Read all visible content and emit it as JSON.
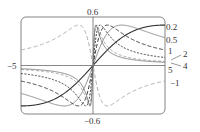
{
  "chart_data": {
    "type": "line",
    "title": "",
    "function": "f(x) = c x / (1 + c^2 x^2)",
    "xlabel": "",
    "ylabel": "",
    "xlim": [
      -5,
      5
    ],
    "ylim": [
      -0.6,
      0.6
    ],
    "grid": false,
    "legend": "inline labels at right edge",
    "tick_labels": {
      "x_left": "−5",
      "x_right": "5",
      "y_top": "0.6",
      "y_bottom": "−0.6"
    },
    "series": [
      {
        "name": "0.2",
        "c": 0.2,
        "color": "#333333",
        "dash": "",
        "width": 1.1
      },
      {
        "name": "0.5",
        "c": 0.5,
        "color": "#888888",
        "dash": "",
        "width": 1.0
      },
      {
        "name": "1",
        "c": 1,
        "color": "#333333",
        "dash": "4,2",
        "width": 1.0
      },
      {
        "name": "2",
        "c": 2,
        "color": "#333333",
        "dash": "2,1.5",
        "width": 1.0
      },
      {
        "name": "4",
        "c": 4,
        "color": "#999999",
        "dash": "3,2",
        "width": 0.9
      },
      {
        "name": "5",
        "c": 5,
        "color": "#666666",
        "dash": "",
        "width": 0.8
      },
      {
        "name": "−1",
        "c": -1,
        "color": "#aaaaaa",
        "dash": "4,2.5",
        "width": 1.0
      }
    ],
    "curve_labels": [
      {
        "text": "0.2",
        "x": 166,
        "y": 30
      },
      {
        "text": "0.5",
        "x": 166,
        "y": 43
      },
      {
        "text": "1",
        "x": 168,
        "y": 54
      },
      {
        "text": "2",
        "x": 183,
        "y": 57,
        "leader": [
          181,
          55,
          171,
          60
        ]
      },
      {
        "text": "4",
        "x": 183,
        "y": 69,
        "leader": [
          181,
          66,
          171,
          63
        ]
      },
      {
        "text": "5",
        "x": 168,
        "y": 73
      },
      {
        "text": "−1",
        "x": 170,
        "y": 86
      }
    ]
  }
}
